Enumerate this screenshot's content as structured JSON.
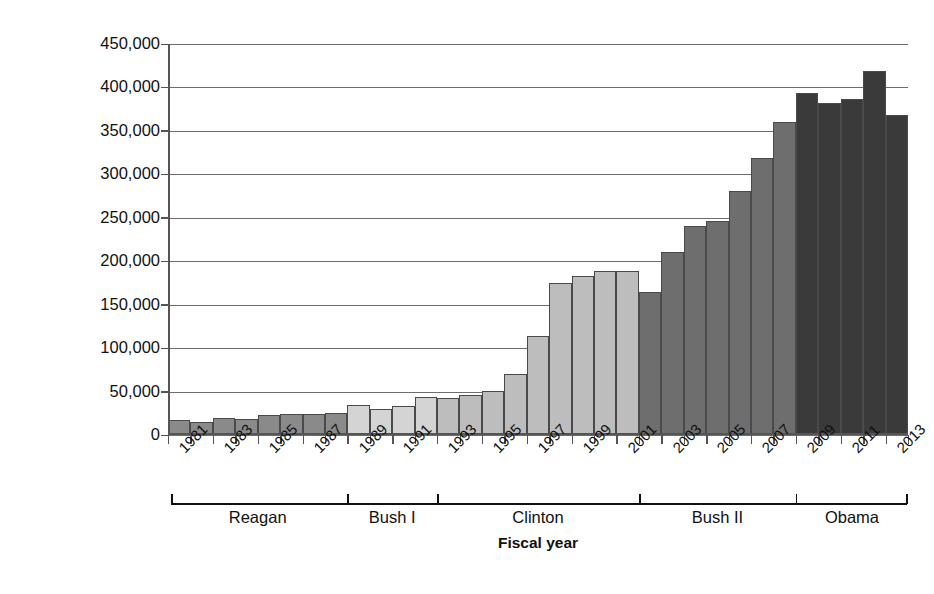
{
  "chart_data": {
    "type": "bar",
    "title": "",
    "xlabel": "Fiscal year",
    "ylabel": "Deportations",
    "ylim": [
      0,
      450000
    ],
    "ytick_labels": [
      "450,000",
      "400,000",
      "350,000",
      "300,000",
      "250,000",
      "200,000",
      "150,000",
      "100,000",
      "50,000",
      "0"
    ],
    "ytick_values": [
      450000,
      400000,
      350000,
      300000,
      250000,
      200000,
      150000,
      100000,
      50000,
      0
    ],
    "grid": true,
    "legend": "none",
    "categories": [
      1981,
      1982,
      1983,
      1984,
      1985,
      1986,
      1987,
      1988,
      1989,
      1990,
      1991,
      1992,
      1993,
      1994,
      1995,
      1996,
      1997,
      1998,
      1999,
      2000,
      2001,
      2002,
      2003,
      2004,
      2005,
      2006,
      2007,
      2008,
      2009,
      2010,
      2011,
      2012,
      2013
    ],
    "visible_tick_labels": [
      "1981",
      "1983",
      "1985",
      "1987",
      "1989",
      "1991",
      "1993",
      "1995",
      "1997",
      "1999",
      "2001",
      "2003",
      "2005",
      "2007",
      "2009",
      "2011",
      "2013"
    ],
    "values": [
      17379,
      15216,
      19211,
      18696,
      23105,
      24592,
      24336,
      25829,
      34427,
      30039,
      33189,
      43671,
      42542,
      45674,
      50924,
      69680,
      114432,
      174813,
      183114,
      188467,
      189026,
      165168,
      211098,
      240665,
      246431,
      280974,
      319382,
      359795,
      393289,
      382627,
      387242,
      419384,
      368644
    ],
    "bar_shades": [
      "#8a8a8a",
      "#8a8a8a",
      "#8a8a8a",
      "#8a8a8a",
      "#8a8a8a",
      "#8a8a8a",
      "#8a8a8a",
      "#8a8a8a",
      "#d4d4d4",
      "#d4d4d4",
      "#d4d4d4",
      "#d4d4d4",
      "#bdbdbd",
      "#bdbdbd",
      "#bdbdbd",
      "#bdbdbd",
      "#bdbdbd",
      "#bdbdbd",
      "#bdbdbd",
      "#bdbdbd",
      "#bdbdbd",
      "#6e6e6e",
      "#6e6e6e",
      "#6e6e6e",
      "#6e6e6e",
      "#6e6e6e",
      "#6e6e6e",
      "#6e6e6e",
      "#3a3a3a",
      "#3a3a3a",
      "#3a3a3a",
      "#3a3a3a",
      "#3a3a3a"
    ],
    "administrations": [
      {
        "name": "Reagan",
        "start_year": 1981,
        "end_year": 1988,
        "shade": "#8a8a8a"
      },
      {
        "name": "Bush I",
        "start_year": 1989,
        "end_year": 1992,
        "shade": "#d4d4d4"
      },
      {
        "name": "Clinton",
        "start_year": 1993,
        "end_year": 2001,
        "shade": "#bdbdbd"
      },
      {
        "name": "Bush II",
        "start_year": 2002,
        "end_year": 2008,
        "shade": "#6e6e6e"
      },
      {
        "name": "Obama",
        "start_year": 2009,
        "end_year": 2013,
        "shade": "#3a3a3a"
      }
    ]
  },
  "colors": {
    "grid": "#6d6d6d",
    "axis": "#555555",
    "bar_outline": "#4a4a4a",
    "text": "#111111",
    "background": "#ffffff"
  }
}
